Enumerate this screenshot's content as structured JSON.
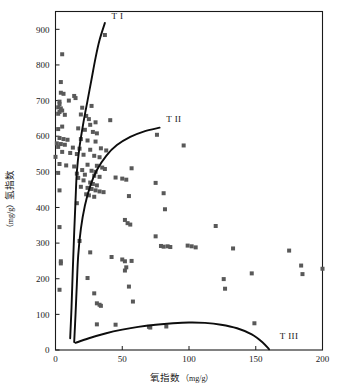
{
  "chart_data": {
    "type": "scatter",
    "title": "",
    "xlabel": "氧指数（mg/g）",
    "ylabel": "氢指数（mg/g）",
    "xlim": [
      0,
      200
    ],
    "ylim": [
      0,
      950
    ],
    "xticks": [
      0,
      50,
      100,
      150,
      200
    ],
    "yticks": [
      0,
      100,
      200,
      300,
      400,
      500,
      600,
      700,
      800,
      900
    ],
    "xtick_labels": [
      "0",
      "50",
      "100",
      "150",
      "200"
    ],
    "ytick_labels": [
      "0",
      "100",
      "200",
      "300",
      "400",
      "500",
      "600",
      "700",
      "800",
      "900"
    ],
    "grid": false,
    "legend": "none",
    "marker": {
      "shape": "square",
      "color": "#595959",
      "size_px": 4
    },
    "series": [
      {
        "name": "samples",
        "points": [
          [
            37,
            884
          ],
          [
            5,
            830
          ],
          [
            4,
            752
          ],
          [
            4,
            722
          ],
          [
            6,
            719
          ],
          [
            14,
            713
          ],
          [
            10,
            700
          ],
          [
            3,
            697
          ],
          [
            3,
            690
          ],
          [
            2,
            681
          ],
          [
            4,
            678
          ],
          [
            5,
            672
          ],
          [
            3,
            668
          ],
          [
            2,
            663
          ],
          [
            7,
            660
          ],
          [
            15,
            707
          ],
          [
            20,
            680
          ],
          [
            27,
            685
          ],
          [
            19,
            661
          ],
          [
            23,
            657
          ],
          [
            25,
            648
          ],
          [
            41,
            645
          ],
          [
            30,
            639
          ],
          [
            26,
            632
          ],
          [
            5,
            627
          ],
          [
            2,
            620
          ],
          [
            17,
            622
          ],
          [
            22,
            618
          ],
          [
            28,
            612
          ],
          [
            31,
            608
          ],
          [
            76,
            604
          ],
          [
            3,
            595
          ],
          [
            6,
            592
          ],
          [
            9,
            590
          ],
          [
            19,
            592
          ],
          [
            24,
            588
          ],
          [
            30,
            585
          ],
          [
            1,
            580
          ],
          [
            4,
            578
          ],
          [
            7,
            576
          ],
          [
            96,
            574
          ],
          [
            2,
            570
          ],
          [
            13,
            568
          ],
          [
            18,
            565
          ],
          [
            26,
            562
          ],
          [
            34,
            566
          ],
          [
            38,
            560
          ],
          [
            0,
            542
          ],
          [
            5,
            556
          ],
          [
            11,
            553
          ],
          [
            16,
            550
          ],
          [
            21,
            548
          ],
          [
            29,
            545
          ],
          [
            33,
            541
          ],
          [
            57,
            510
          ],
          [
            3,
            522
          ],
          [
            8,
            518
          ],
          [
            14,
            515
          ],
          [
            24,
            520
          ],
          [
            31,
            517
          ],
          [
            35,
            512
          ],
          [
            37,
            508
          ],
          [
            20,
            505
          ],
          [
            27,
            503
          ],
          [
            30,
            500
          ],
          [
            2,
            497
          ],
          [
            16,
            495
          ],
          [
            22,
            492
          ],
          [
            29,
            489
          ],
          [
            33,
            486
          ],
          [
            45,
            484
          ],
          [
            50,
            481
          ],
          [
            53,
            478
          ],
          [
            3,
            448
          ],
          [
            17,
            483
          ],
          [
            21,
            476
          ],
          [
            26,
            470
          ],
          [
            28,
            466
          ],
          [
            31,
            462
          ],
          [
            75,
            469
          ],
          [
            19,
            458
          ],
          [
            24,
            455
          ],
          [
            27,
            452
          ],
          [
            30,
            448
          ],
          [
            33,
            445
          ],
          [
            36,
            443
          ],
          [
            81,
            440
          ],
          [
            23,
            437
          ],
          [
            25,
            434
          ],
          [
            29,
            430
          ],
          [
            55,
            432
          ],
          [
            16,
            412
          ],
          [
            82,
            395
          ],
          [
            52,
            365
          ],
          [
            54,
            356
          ],
          [
            56,
            352
          ],
          [
            120,
            348
          ],
          [
            3,
            345
          ],
          [
            18,
            306
          ],
          [
            75,
            319
          ],
          [
            79,
            292
          ],
          [
            81,
            290
          ],
          [
            84,
            291
          ],
          [
            86,
            289
          ],
          [
            99,
            293
          ],
          [
            102,
            291
          ],
          [
            105,
            288
          ],
          [
            133,
            285
          ],
          [
            175,
            279
          ],
          [
            26,
            274
          ],
          [
            42,
            261
          ],
          [
            50,
            254
          ],
          [
            52,
            249
          ],
          [
            57,
            250
          ],
          [
            4,
            249
          ],
          [
            4,
            243
          ],
          [
            53,
            232
          ],
          [
            184,
            237
          ],
          [
            200,
            228
          ],
          [
            52,
            223
          ],
          [
            147,
            215
          ],
          [
            185,
            213
          ],
          [
            126,
            199
          ],
          [
            24,
            202
          ],
          [
            55,
            178
          ],
          [
            127,
            172
          ],
          [
            3,
            169
          ],
          [
            29,
            159
          ],
          [
            31,
            131
          ],
          [
            33,
            127
          ],
          [
            34,
            124
          ],
          [
            58,
            136
          ],
          [
            31,
            72
          ],
          [
            45,
            71
          ],
          [
            70,
            65
          ],
          [
            71,
            63
          ],
          [
            83,
            66
          ],
          [
            149,
            75
          ]
        ]
      }
    ],
    "curves": [
      {
        "name": "Type I",
        "label": "T I",
        "label_x": 42,
        "label_y": 930,
        "path_points": [
          [
            11,
            33
          ],
          [
            12,
            120
          ],
          [
            13,
            230
          ],
          [
            14,
            330
          ],
          [
            15,
            420
          ],
          [
            16,
            500
          ],
          [
            18,
            570
          ],
          [
            21,
            640
          ],
          [
            24,
            700
          ],
          [
            27,
            760
          ],
          [
            30,
            820
          ],
          [
            33,
            870
          ],
          [
            37,
            918
          ]
        ]
      },
      {
        "name": "Type II",
        "label": "T II",
        "label_x": 83,
        "label_y": 640,
        "path_points": [
          [
            14,
            22
          ],
          [
            15,
            100
          ],
          [
            16,
            185
          ],
          [
            17,
            265
          ],
          [
            19,
            340
          ],
          [
            22,
            405
          ],
          [
            26,
            460
          ],
          [
            31,
            505
          ],
          [
            38,
            545
          ],
          [
            46,
            575
          ],
          [
            56,
            598
          ],
          [
            66,
            613
          ],
          [
            78,
            624
          ]
        ]
      },
      {
        "name": "Type III",
        "label": "T III",
        "label_x": 168,
        "label_y": 32,
        "path_points": [
          [
            15,
            20
          ],
          [
            25,
            33
          ],
          [
            38,
            47
          ],
          [
            50,
            57
          ],
          [
            62,
            65
          ],
          [
            75,
            71
          ],
          [
            88,
            75
          ],
          [
            100,
            77
          ],
          [
            112,
            76
          ],
          [
            124,
            71
          ],
          [
            136,
            61
          ],
          [
            147,
            44
          ],
          [
            155,
            22
          ],
          [
            160,
            2
          ]
        ]
      }
    ]
  },
  "axes": {
    "x_title_main": "氧指数",
    "x_title_unit": "（mg/g）",
    "y_title_main": "氢指数",
    "y_title_unit": "（mg/g）"
  }
}
